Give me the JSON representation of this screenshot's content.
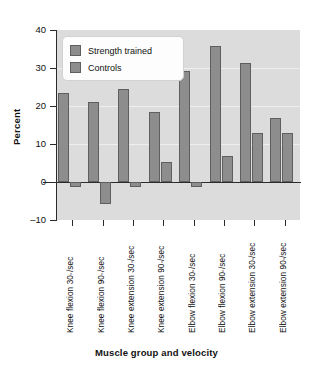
{
  "chart_data": {
    "type": "bar",
    "title": "",
    "xlabel": "Muscle group and velocity",
    "ylabel": "Percent",
    "ylim": [
      -10,
      40
    ],
    "yticks": [
      40,
      30,
      20,
      10,
      0,
      -10
    ],
    "ytick_labels": [
      "40",
      "30",
      "20",
      "10",
      "0",
      "–10"
    ],
    "grid": true,
    "legend_position": "upper-left-inside",
    "categories": [
      "Knee flexion 30°/sec",
      "Knee flexion 90°/sec",
      "Knee extension 30°/sec",
      "Knee extension 90°/sec",
      "Elbow flexion 30°/sec",
      "Elbow flexion 90°/sec",
      "Elbow extension 30°/sec",
      "Elbow extension 90°/sec"
    ],
    "series": [
      {
        "name": "Strength trained",
        "color": "#8d8d8d",
        "values": [
          23.4,
          21.0,
          24.4,
          18.3,
          29.3,
          35.8,
          31.3,
          16.9
        ]
      },
      {
        "name": "Controls",
        "color": "#8d8d8d",
        "values": [
          -1.3,
          -5.8,
          -1.4,
          5.2,
          -1.3,
          6.8,
          13.0,
          13.0
        ]
      }
    ]
  },
  "axis": {
    "ylabel": "Percent",
    "xlabel": "Muscle group and velocity",
    "ytick_labels": [
      "40",
      "30",
      "20",
      "10",
      "0",
      "–10"
    ]
  },
  "legend": {
    "items": [
      {
        "label": "Strength trained"
      },
      {
        "label": "Controls"
      }
    ]
  },
  "xtick_labels": [
    {
      "main": "Knee flexion 30",
      "deg": "°",
      "tail": "/sec"
    },
    {
      "main": "Knee flexion 90",
      "deg": "°",
      "tail": "/sec"
    },
    {
      "main": "Knee extension 30",
      "deg": "°",
      "tail": "/sec"
    },
    {
      "main": "Knee extension 90",
      "deg": "°",
      "tail": "/sec"
    },
    {
      "main": "Elbow flexion 30",
      "deg": "°",
      "tail": "/sec"
    },
    {
      "main": "Elbow flexion 90",
      "deg": "°",
      "tail": "/sec"
    },
    {
      "main": "Elbow extension 30",
      "deg": "°",
      "tail": "/sec"
    },
    {
      "main": "Elbow extension 90",
      "deg": "°",
      "tail": "/sec"
    }
  ],
  "colors": {
    "bar_fill": "#8d8d8d",
    "bar_edge": "#5f5f5f",
    "plot_background": "#dcdcdc",
    "axis": "#2b2b2b",
    "page_background": "#ffffff"
  }
}
